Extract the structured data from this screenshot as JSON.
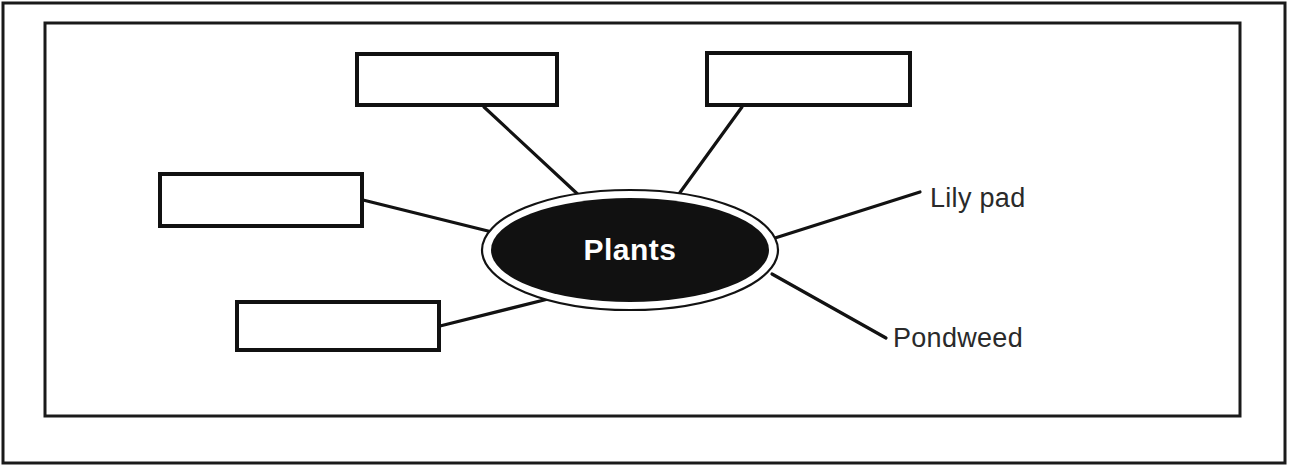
{
  "diagram": {
    "type": "concept-map",
    "title_node": {
      "label": "Plants",
      "fill_color": "#111111",
      "text_color": "#ffffff",
      "cx": 630,
      "cy": 250,
      "rx": 145,
      "ry": 57
    },
    "answer_boxes": [
      {
        "id": "box-top-left",
        "label": "",
        "x": 357,
        "y": 54,
        "width": 200,
        "height": 51
      },
      {
        "id": "box-top-right",
        "label": "",
        "x": 707,
        "y": 53,
        "width": 203,
        "height": 52
      },
      {
        "id": "box-left",
        "label": "",
        "x": 160,
        "y": 174,
        "width": 202,
        "height": 52
      },
      {
        "id": "box-bottom-left",
        "label": "",
        "x": 237,
        "y": 302,
        "width": 202,
        "height": 48
      }
    ],
    "leaf_labels": [
      {
        "id": "label-lily-pad",
        "label": "Lily pad",
        "x": 930,
        "y": 200
      },
      {
        "id": "label-pondweed",
        "label": "Pondweed",
        "x": 893,
        "y": 340
      }
    ],
    "connectors": [
      {
        "id": "connector-top-left",
        "x1": 484,
        "y1": 107,
        "x2": 584,
        "y2": 200
      },
      {
        "id": "connector-top-right",
        "x1": 742,
        "y1": 107,
        "x2": 676,
        "y2": 198
      },
      {
        "id": "connector-left",
        "x1": 363,
        "y1": 200,
        "x2": 492,
        "y2": 232
      },
      {
        "id": "connector-bottom-left",
        "x1": 440,
        "y1": 326,
        "x2": 556,
        "y2": 297
      },
      {
        "id": "connector-lily-pad",
        "x1": 775,
        "y1": 238,
        "x2": 920,
        "y2": 192
      },
      {
        "id": "connector-pondweed",
        "x1": 772,
        "y1": 274,
        "x2": 886,
        "y2": 338
      }
    ],
    "frames": {
      "outer": {
        "x": 3,
        "y": 3,
        "width": 1282,
        "height": 460
      },
      "inner": {
        "x": 45,
        "y": 23,
        "width": 1195,
        "height": 393
      }
    }
  }
}
